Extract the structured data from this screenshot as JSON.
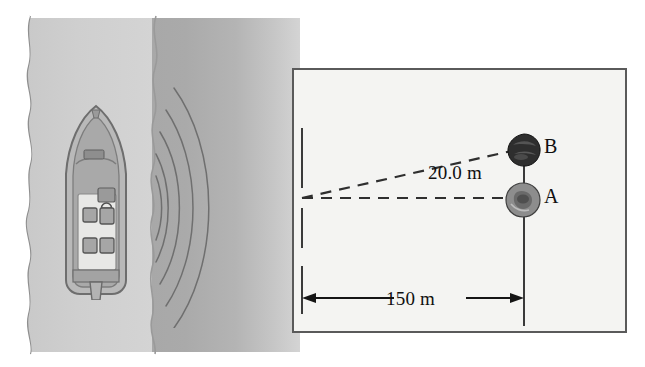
{
  "figure": {
    "type": "physics-diagram",
    "scene": {
      "vessel": "motorboat-top-view",
      "emission": "sonar-wavefronts",
      "wavefront_count": 5,
      "water_bands": [
        "shoreline-shallow",
        "deep-water"
      ]
    },
    "panel": {
      "background_color": "#f4f4f2",
      "border_color": "#5a5a5a"
    },
    "labels": {
      "rock_b": "B",
      "rock_a": "A",
      "vertical_separation": "20.0 m",
      "horizontal_distance": "150 m"
    },
    "objects": [
      {
        "id": "B",
        "name": "rock-b",
        "label": "B",
        "shade": "dark",
        "color": "#2e2e2e"
      },
      {
        "id": "A",
        "name": "rock-a",
        "label": "A",
        "shade": "medium",
        "color": "#8d8d8d"
      }
    ],
    "measurements": [
      {
        "name": "vertical-separation",
        "value": 20.0,
        "unit": "m",
        "display": "20.0 m",
        "between": [
          "A",
          "B"
        ]
      },
      {
        "name": "horizontal-distance",
        "value": 150,
        "unit": "m",
        "display": "150 m",
        "between": [
          "boat",
          "A"
        ]
      }
    ],
    "lines": [
      {
        "name": "sight-line-to-b",
        "style": "dashed"
      },
      {
        "name": "sight-line-to-a",
        "style": "dashed"
      },
      {
        "name": "vertical-reference-line",
        "style": "solid"
      },
      {
        "name": "left-extension-line",
        "style": "solid"
      },
      {
        "name": "dimension-arrow-150m",
        "style": "double-headed-arrow"
      }
    ]
  }
}
